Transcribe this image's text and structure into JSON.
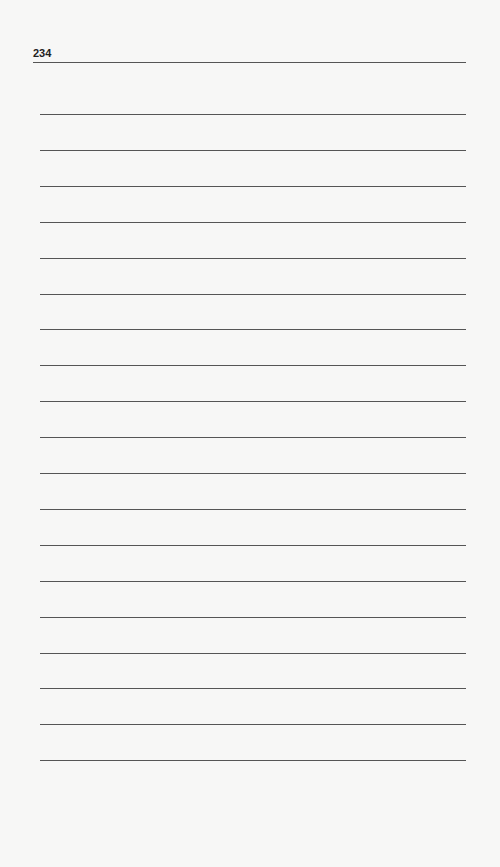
{
  "page": {
    "number": "234",
    "ruled_line_count": 19,
    "first_line_top": 114,
    "line_spacing": 35.9
  }
}
